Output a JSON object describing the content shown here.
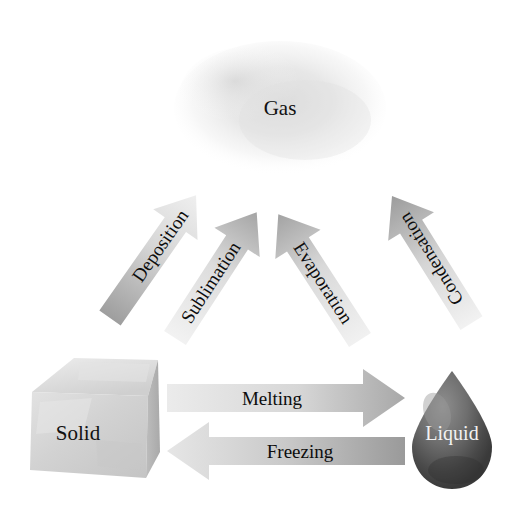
{
  "diagram": {
    "background_color": "#ffffff"
  },
  "states": [
    {
      "id": "gas",
      "label": "Gas",
      "shape": "cloud-ellipse",
      "label_color": "#111111",
      "fill_color": "#e6e6e6",
      "cx": 280,
      "cy": 108,
      "rx": 105,
      "ry": 66
    },
    {
      "id": "solid",
      "label": "Solid",
      "shape": "ice-cube",
      "label_color": "#111111",
      "fill_color": "#d8d8d8",
      "cx": 95,
      "cy": 425
    },
    {
      "id": "liquid",
      "label": "Liquid",
      "shape": "water-droplet",
      "label_color": "#f2f2f2",
      "fill_color": "#6d6d6d",
      "cx": 452,
      "cy": 432
    }
  ],
  "transitions": [
    {
      "id": "deposition",
      "label": "Deposition",
      "from": "gas",
      "to": "solid",
      "direction": "down-left",
      "tail_color": "#ededed",
      "head_color": "#9e9e9e"
    },
    {
      "id": "sublimation",
      "label": "Sublimation",
      "from": "solid",
      "to": "gas",
      "direction": "up-right",
      "tail_color": "#ececec",
      "head_color": "#a5a5a5"
    },
    {
      "id": "evaporation",
      "label": "Evaporation",
      "from": "liquid",
      "to": "gas",
      "direction": "up-left",
      "tail_color": "#ededed",
      "head_color": "#a3a3a3"
    },
    {
      "id": "condensation",
      "label": "Condensation",
      "from": "gas",
      "to": "liquid",
      "direction": "down-right",
      "tail_color": "#efefef",
      "head_color": "#9c9c9c"
    },
    {
      "id": "melting",
      "label": "Melting",
      "from": "solid",
      "to": "liquid",
      "direction": "right",
      "tail_color": "#ebebeb",
      "head_color": "#a8a8a8"
    },
    {
      "id": "freezing",
      "label": "Freezing",
      "from": "liquid",
      "to": "solid",
      "direction": "left",
      "tail_color": "#e4e4e4",
      "head_color": "#9a9a9a"
    }
  ]
}
